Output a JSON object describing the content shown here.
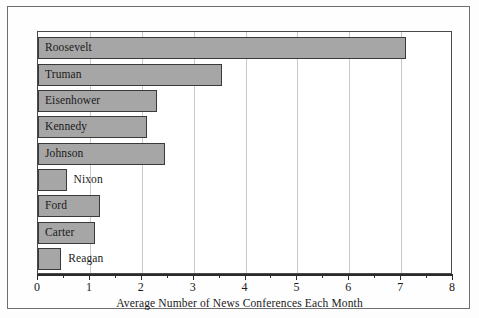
{
  "chart_data": {
    "type": "bar",
    "orientation": "horizontal",
    "title": "",
    "xlabel": "Average Number of News Conferences Each Month",
    "ylabel": "",
    "categories": [
      "Roosevelt",
      "Truman",
      "Eisenhower",
      "Kennedy",
      "Johnson",
      "Nixon",
      "Ford",
      "Carter",
      "Reagan"
    ],
    "values": [
      7.1,
      3.55,
      2.3,
      2.1,
      2.45,
      0.55,
      1.2,
      1.1,
      0.45
    ],
    "xlim": [
      0,
      8
    ],
    "xticks": [
      0,
      1,
      2,
      3,
      4,
      5,
      6,
      7,
      8
    ],
    "xtick_labels": [
      "0",
      "1",
      "2",
      "3",
      "4",
      "5",
      "6",
      "7",
      "8"
    ],
    "minor_xticks": [
      0.5,
      1.5,
      2.5,
      3.5,
      4.5,
      5.5,
      6.5,
      7.5
    ],
    "grid": true,
    "grid_axis": "x",
    "legend": false,
    "label_placement": [
      "inside",
      "inside",
      "inside",
      "inside",
      "inside",
      "outside",
      "inside",
      "inside",
      "outside"
    ],
    "colors": {
      "bar_fill": "#a6a6a6",
      "bar_edge": "#3a3a3a",
      "bar_shadow": "#1c1c1c",
      "gridline": "#c9c9c9",
      "axis": "#2b2b2b",
      "frame": "#6e6e6e",
      "text": "#1a1a1a",
      "background": "#ffffff"
    }
  }
}
